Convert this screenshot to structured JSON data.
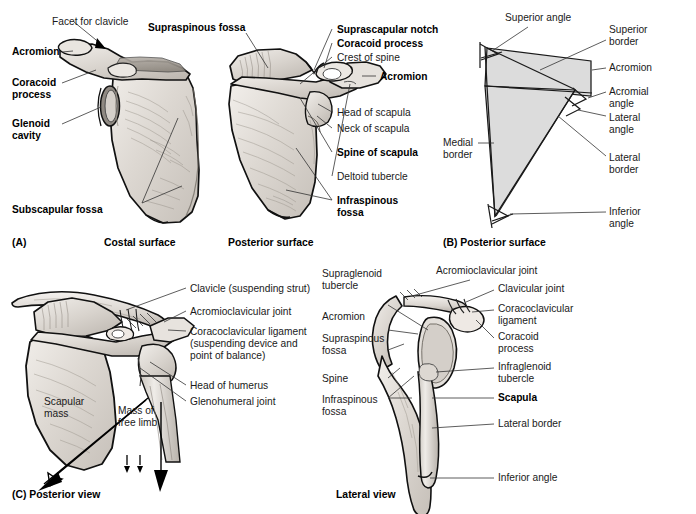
{
  "figure": {
    "background": "#ffffff",
    "bone_fill": "#dedad5",
    "schematic_fill": "#dcdcdc",
    "leader_color": "#333333"
  },
  "panels": [
    {
      "id": "A",
      "caption": "(A)",
      "subcaptions": [
        "Costal surface",
        "Posterior surface"
      ],
      "labels_left": [
        {
          "text": "Facet for clavicle",
          "bold": false
        },
        {
          "text": "Acromion",
          "bold": true
        },
        {
          "text": "Coracoid",
          "bold": true
        },
        {
          "text": "process",
          "bold": true
        },
        {
          "text": "Glenoid",
          "bold": true
        },
        {
          "text": "cavity",
          "bold": true
        },
        {
          "text": "Subscapular fossa",
          "bold": true
        }
      ],
      "labels_center": [
        {
          "text": "Supraspinous fossa",
          "bold": true
        }
      ],
      "labels_right": [
        {
          "text": "Suprascapular notch",
          "bold": true
        },
        {
          "text": "Coracoid process",
          "bold": true
        },
        {
          "text": "Crest of spine",
          "bold": false
        },
        {
          "text": "Acromion",
          "bold": true
        },
        {
          "text": "Head of scapula",
          "bold": false
        },
        {
          "text": "Neck of scapula",
          "bold": false
        },
        {
          "text": "Spine of scapula",
          "bold": true
        },
        {
          "text": "Deltoid tubercle",
          "bold": false
        },
        {
          "text": "Infraspinous",
          "bold": true
        },
        {
          "text": "fossa",
          "bold": true
        }
      ]
    },
    {
      "id": "B",
      "caption": "(B) Posterior surface",
      "labels": [
        {
          "text": "Superior angle",
          "bold": false
        },
        {
          "text": "Superior",
          "bold": false
        },
        {
          "text": "border",
          "bold": false
        },
        {
          "text": "Acromion",
          "bold": false
        },
        {
          "text": "Acromial",
          "bold": false
        },
        {
          "text": "angle",
          "bold": false
        },
        {
          "text": "Lateral",
          "bold": false
        },
        {
          "text": "angle",
          "bold": false
        },
        {
          "text": "Medial",
          "bold": false
        },
        {
          "text": "border",
          "bold": false
        },
        {
          "text": "Lateral",
          "bold": false
        },
        {
          "text": "border",
          "bold": false
        },
        {
          "text": "Inferior",
          "bold": false
        },
        {
          "text": "angle",
          "bold": false
        }
      ]
    },
    {
      "id": "C",
      "caption": "(C) Posterior view",
      "labels": [
        {
          "text": "Clavicle (suspending strut)",
          "bold": false
        },
        {
          "text": "Acromioclavicular joint",
          "bold": false
        },
        {
          "text": "Coracoclavicular ligament",
          "bold": false
        },
        {
          "text": "(suspending device and",
          "bold": false
        },
        {
          "text": "point of balance)",
          "bold": false
        },
        {
          "text": "Head of humerus",
          "bold": false
        },
        {
          "text": "Glenohumeral joint",
          "bold": false
        },
        {
          "text": "Scapular",
          "bold": false
        },
        {
          "text": "mass",
          "bold": false
        },
        {
          "text": "Mass of",
          "bold": false
        },
        {
          "text": "free limb",
          "bold": false
        }
      ]
    },
    {
      "id": "D",
      "caption": "Lateral view",
      "labels_left": [
        {
          "text": "Supraglenoid",
          "bold": false
        },
        {
          "text": "tubercle",
          "bold": false
        },
        {
          "text": "Acromion",
          "bold": false
        },
        {
          "text": "Supraspinous",
          "bold": false
        },
        {
          "text": "fossa",
          "bold": false
        },
        {
          "text": "Spine",
          "bold": false
        },
        {
          "text": "Infraspinous",
          "bold": false
        },
        {
          "text": "fossa",
          "bold": false
        }
      ],
      "labels_top": [
        {
          "text": "Acromioclavicular joint",
          "bold": false
        }
      ],
      "labels_right": [
        {
          "text": "Clavicular joint",
          "bold": false
        },
        {
          "text": "Coracoclavicular",
          "bold": false
        },
        {
          "text": "ligament",
          "bold": false
        },
        {
          "text": "Coracoid",
          "bold": false
        },
        {
          "text": "process",
          "bold": false
        },
        {
          "text": "Infraglenoid",
          "bold": false
        },
        {
          "text": "tubercle",
          "bold": false
        },
        {
          "text": "Scapula",
          "bold": true
        },
        {
          "text": "Lateral border",
          "bold": false
        },
        {
          "text": "Inferior angle",
          "bold": false
        }
      ]
    }
  ]
}
